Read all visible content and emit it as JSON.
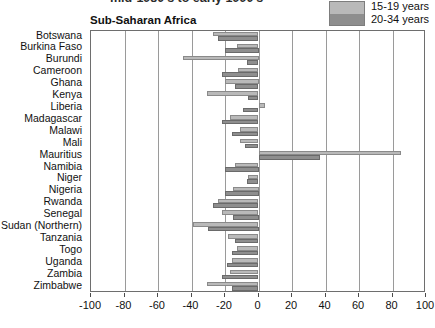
{
  "title_cropped": "mid-1980's to early 1990's",
  "panel": {
    "heading": "Sub-Saharan Africa"
  },
  "legend": {
    "items": [
      {
        "label": "15-19 years",
        "color": "#b9b9b9",
        "key": "y1519"
      },
      {
        "label": "20-34 years",
        "color": "#8e8e8e",
        "key": "y2034"
      }
    ]
  },
  "chart_data": {
    "type": "bar",
    "orientation": "horizontal",
    "title": "mid-1980's to early 1990's",
    "subtitle": "Sub-Saharan Africa",
    "xlabel": "",
    "ylabel": "",
    "xlim": [
      -100,
      100
    ],
    "xticks": [
      -100,
      -80,
      -60,
      -40,
      -20,
      0,
      20,
      40,
      60,
      80,
      100
    ],
    "xticklabels": [
      "-100",
      "-80",
      "-60",
      "-40",
      "-20",
      "0",
      "20",
      "40",
      "60",
      "80",
      "100"
    ],
    "grid": true,
    "legend_position": "top-right",
    "categories": [
      "Botswana",
      "Burkina Faso",
      "Burundi",
      "Cameroon",
      "Ghana",
      "Kenya",
      "Liberia",
      "Madagascar",
      "Malawi",
      "Mali",
      "Mauritius",
      "Namibia",
      "Niger",
      "Nigeria",
      "Rwanda",
      "Senegal",
      "Sudan (Northern)",
      "Tanzania",
      "Togo",
      "Uganda",
      "Zambia",
      "Zimbabwe"
    ],
    "series": [
      {
        "name": "15-19 years",
        "color": "#b9b9b9",
        "values": [
          -27,
          -13,
          -45,
          -12,
          -20,
          -31,
          4,
          -17,
          -11,
          -11,
          85,
          -14,
          -6,
          -15,
          -24,
          -22,
          -39,
          -18,
          -13,
          -16,
          -17,
          -31
        ]
      },
      {
        "name": "20-34 years",
        "color": "#8e8e8e",
        "values": [
          -24,
          -20,
          -7,
          -22,
          -14,
          -6,
          -9,
          -22,
          -16,
          -8,
          37,
          -20,
          -7,
          -20,
          -27,
          -15,
          -30,
          -14,
          -16,
          -19,
          -22,
          -16
        ]
      }
    ]
  }
}
